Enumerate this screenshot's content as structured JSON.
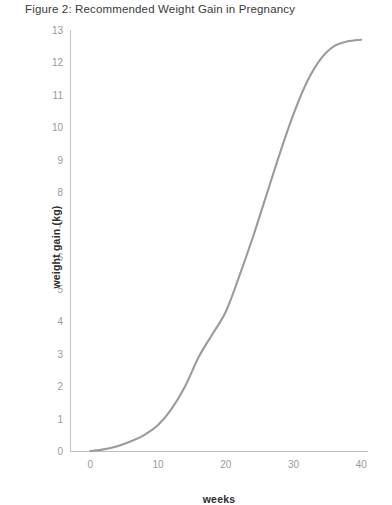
{
  "figure": {
    "title": "Figure 2: Recommended Weight Gain in Pregnancy"
  },
  "axes": {
    "x_label": "weeks",
    "y_label": "weight gain (kg)"
  },
  "colors": {
    "curve": "#9b9b9b",
    "axis": "#c2c2c2",
    "tick_text": "#9a9a9a",
    "title_text": "#3a3a3a",
    "axis_label_text": "#2e2e2e"
  },
  "ticks": {
    "y": [
      "13",
      "12",
      "11",
      "10",
      "9",
      "8",
      "7",
      "6",
      "5",
      "4",
      "3",
      "2",
      "1",
      "0"
    ],
    "x": [
      "0",
      "10",
      "20",
      "30",
      "40"
    ]
  },
  "chart_data": {
    "type": "line",
    "title": "Figure 2: Recommended Weight Gain in Pregnancy",
    "xlabel": "weeks",
    "ylabel": "weight gain (kg)",
    "xlim": [
      -3,
      41
    ],
    "ylim": [
      0,
      13
    ],
    "xticks": [
      0,
      10,
      20,
      30,
      40
    ],
    "yticks": [
      0,
      1,
      2,
      3,
      4,
      5,
      6,
      7,
      8,
      9,
      10,
      11,
      12,
      13
    ],
    "grid": false,
    "legend": "none",
    "series": [
      {
        "name": "Recommended weight gain",
        "color": "#9b9b9b",
        "x": [
          0,
          2,
          4,
          6,
          8,
          10,
          12,
          14,
          16,
          18,
          20,
          22,
          24,
          26,
          28,
          30,
          32,
          34,
          36,
          38,
          40
        ],
        "y": [
          0.0,
          0.05,
          0.15,
          0.3,
          0.5,
          0.8,
          1.3,
          2.0,
          2.9,
          3.6,
          4.3,
          5.4,
          6.6,
          7.9,
          9.2,
          10.4,
          11.4,
          12.1,
          12.5,
          12.65,
          12.7
        ]
      }
    ]
  }
}
